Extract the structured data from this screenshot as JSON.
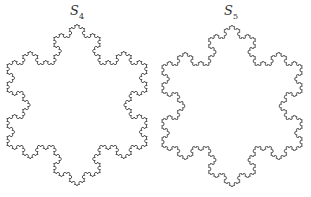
{
  "figures": [
    {
      "label": "S",
      "subscript": "4",
      "iteration": 4,
      "center_x": 77,
      "center_y": 105,
      "radius": 81,
      "label_x": 70,
      "label_y": 5
    },
    {
      "label": "S",
      "subscript": "5",
      "iteration": 5,
      "center_x": 232,
      "center_y": 106,
      "radius": 81,
      "label_x": 224,
      "label_y": 5
    }
  ],
  "stroke_color": "#444444"
}
